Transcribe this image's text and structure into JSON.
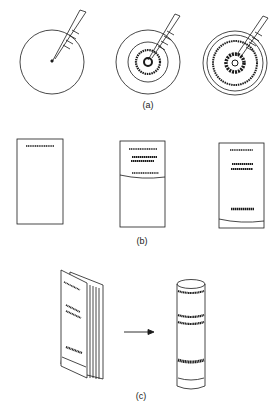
{
  "panels": {
    "a": {
      "label": "(a)",
      "description": "Sample spotted on circular paper; solvent applied at center spreads outward forming concentric rings"
    },
    "b": {
      "label": "(b)",
      "description": "Rectangular paper strips showing ascending chromatography development with separated bands and solvent front"
    },
    "c": {
      "label": "(c)",
      "description": "Stacked paper sheets with bands rolled into a cylindrical column showing corresponding band positions"
    }
  },
  "colors": {
    "ink": "#1a1a1a",
    "background": "#ffffff"
  }
}
